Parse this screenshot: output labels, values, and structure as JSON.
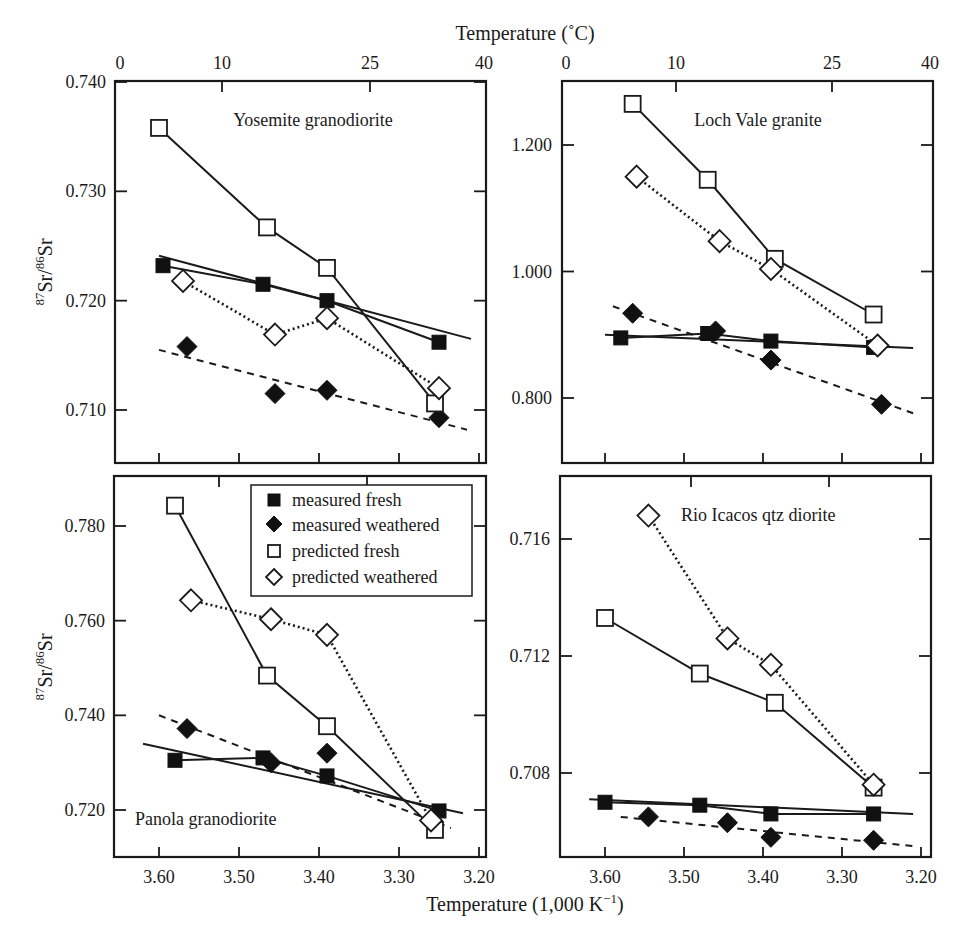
{
  "figure": {
    "top_axis_title": "Temperature (˚C)",
    "bottom_axis_title": "Temperature (1,000 K",
    "bottom_axis_title_sup": "−1",
    "bottom_axis_title_end": ")",
    "ylabel_main": "Sr/",
    "ylabel_sup1": "87",
    "ylabel_sup2": "86",
    "ylabel_end": "Sr",
    "top_ticks": [
      "0",
      "10",
      "25",
      "40"
    ],
    "bottom_ticks": [
      "3.60",
      "3.50",
      "3.40",
      "3.30",
      "3.20"
    ]
  },
  "legend": {
    "items": [
      {
        "label": "measured fresh",
        "marker": "filled-square"
      },
      {
        "label": "measured weathered",
        "marker": "filled-diamond"
      },
      {
        "label": "predicted fresh",
        "marker": "open-square"
      },
      {
        "label": "predicted weathered",
        "marker": "open-diamond"
      }
    ]
  },
  "chart_data": [
    {
      "type": "scatter",
      "title": "Yosemite granodiorite",
      "xlabel": "Temperature (1,000 K^-1)",
      "x2label": "Temperature (˚C)",
      "ylabel": "87Sr/86Sr",
      "xlim": [
        3.66,
        3.19
      ],
      "ylim": [
        0.7053,
        0.74
      ],
      "yticks": [
        "0.740",
        "0.730",
        "0.720",
        "0.710"
      ],
      "series": [
        {
          "name": "measured fresh",
          "x": [
            3.595,
            3.47,
            3.39,
            3.25
          ],
          "y": [
            0.7232,
            0.7215,
            0.72,
            0.7162
          ]
        },
        {
          "name": "measured weathered",
          "x": [
            3.565,
            3.455,
            3.39,
            3.25
          ],
          "y": [
            0.7158,
            0.7115,
            0.7118,
            0.7093
          ]
        },
        {
          "name": "predicted fresh",
          "x": [
            3.6,
            3.465,
            3.39,
            3.255
          ],
          "y": [
            0.7358,
            0.7267,
            0.723,
            0.7106
          ]
        },
        {
          "name": "predicted weathered",
          "x": [
            3.57,
            3.455,
            3.39,
            3.25
          ],
          "y": [
            0.7218,
            0.7169,
            0.7184,
            0.712
          ]
        },
        {
          "name": "measured fresh fit",
          "style": "solid",
          "x": [
            3.6,
            3.21
          ],
          "y": [
            0.7241,
            0.7165
          ]
        },
        {
          "name": "measured weathered fit",
          "style": "dashed",
          "x": [
            3.6,
            3.215
          ],
          "y": [
            0.7155,
            0.7082
          ]
        }
      ]
    },
    {
      "type": "scatter",
      "title": "Loch Vale granite",
      "xlabel": "Temperature (1,000 K^-1)",
      "x2label": "Temperature (˚C)",
      "ylabel": "87Sr/86Sr",
      "xlim": [
        3.66,
        3.19
      ],
      "ylim": [
        0.7,
        1.3
      ],
      "yticks": [
        "1.200",
        "1.000",
        "0.800"
      ],
      "series": [
        {
          "name": "measured fresh",
          "x": [
            3.58,
            3.47,
            3.39,
            3.26
          ],
          "y": [
            0.895,
            0.902,
            0.89,
            0.88
          ]
        },
        {
          "name": "measured weathered",
          "x": [
            3.565,
            3.46,
            3.39,
            3.25
          ],
          "y": [
            0.934,
            0.906,
            0.86,
            0.79
          ]
        },
        {
          "name": "predicted fresh",
          "x": [
            3.565,
            3.47,
            3.385,
            3.26
          ],
          "y": [
            1.265,
            1.145,
            1.02,
            0.932
          ]
        },
        {
          "name": "predicted weathered",
          "x": [
            3.56,
            3.455,
            3.39,
            3.255
          ],
          "y": [
            1.15,
            1.048,
            1.004,
            0.883
          ]
        },
        {
          "name": "measured fresh fit",
          "style": "solid",
          "x": [
            3.6,
            3.21
          ],
          "y": [
            0.9,
            0.879
          ]
        },
        {
          "name": "measured weathered fit",
          "style": "dashed",
          "x": [
            3.59,
            3.21
          ],
          "y": [
            0.945,
            0.776
          ]
        }
      ]
    },
    {
      "type": "scatter",
      "title": "Panola granodiorite",
      "xlabel": "Temperature (1,000 K^-1)",
      "ylabel": "87Sr/86Sr",
      "xlim": [
        3.66,
        3.19
      ],
      "ylim": [
        0.71,
        0.79
      ],
      "yticks": [
        "0.780",
        "0.760",
        "0.740",
        "0.720"
      ],
      "series": [
        {
          "name": "measured fresh",
          "x": [
            3.58,
            3.47,
            3.39,
            3.25
          ],
          "y": [
            0.7305,
            0.731,
            0.7272,
            0.7198
          ]
        },
        {
          "name": "measured weathered",
          "x": [
            3.565,
            3.46,
            3.39,
            3.26
          ],
          "y": [
            0.7372,
            0.73,
            0.732,
            0.7178
          ]
        },
        {
          "name": "predicted fresh",
          "x": [
            3.58,
            3.465,
            3.39,
            3.255
          ],
          "y": [
            0.7843,
            0.7484,
            0.7377,
            0.7158
          ]
        },
        {
          "name": "predicted weathered",
          "x": [
            3.56,
            3.46,
            3.39,
            3.26
          ],
          "y": [
            0.7643,
            0.7603,
            0.757,
            0.7178
          ]
        },
        {
          "name": "measured fresh fit",
          "style": "solid",
          "x": [
            3.62,
            3.22
          ],
          "y": [
            0.734,
            0.7193
          ]
        },
        {
          "name": "measured weathered fit",
          "style": "dashed",
          "x": [
            3.6,
            3.235
          ],
          "y": [
            0.74,
            0.7162
          ]
        }
      ]
    },
    {
      "type": "scatter",
      "title": "Rio Icacos qtz diorite",
      "xlabel": "Temperature (1,000 K^-1)",
      "ylabel": "87Sr/86Sr",
      "xlim": [
        3.66,
        3.19
      ],
      "ylim": [
        0.7052,
        0.7178
      ],
      "yticks": [
        "0.716",
        "0.712",
        "0.708"
      ],
      "series": [
        {
          "name": "measured fresh",
          "x": [
            3.6,
            3.48,
            3.39,
            3.26
          ],
          "y": [
            0.707,
            0.7069,
            0.7066,
            0.7066
          ]
        },
        {
          "name": "measured weathered",
          "x": [
            3.545,
            3.445,
            3.39,
            3.26
          ],
          "y": [
            0.7065,
            0.7063,
            0.7058,
            0.7057
          ]
        },
        {
          "name": "predicted fresh",
          "x": [
            3.6,
            3.48,
            3.385,
            3.26
          ],
          "y": [
            0.7133,
            0.7114,
            0.7104,
            0.7075
          ]
        },
        {
          "name": "predicted weathered",
          "x": [
            3.545,
            3.445,
            3.39,
            3.26
          ],
          "y": [
            0.7168,
            0.7126,
            0.7117,
            0.7076
          ]
        },
        {
          "name": "measured fresh fit",
          "style": "solid",
          "x": [
            3.62,
            3.21
          ],
          "y": [
            0.7071,
            0.7066
          ]
        },
        {
          "name": "measured weathered fit",
          "style": "dashed",
          "x": [
            3.58,
            3.21
          ],
          "y": [
            0.7065,
            0.7055
          ]
        }
      ]
    }
  ]
}
